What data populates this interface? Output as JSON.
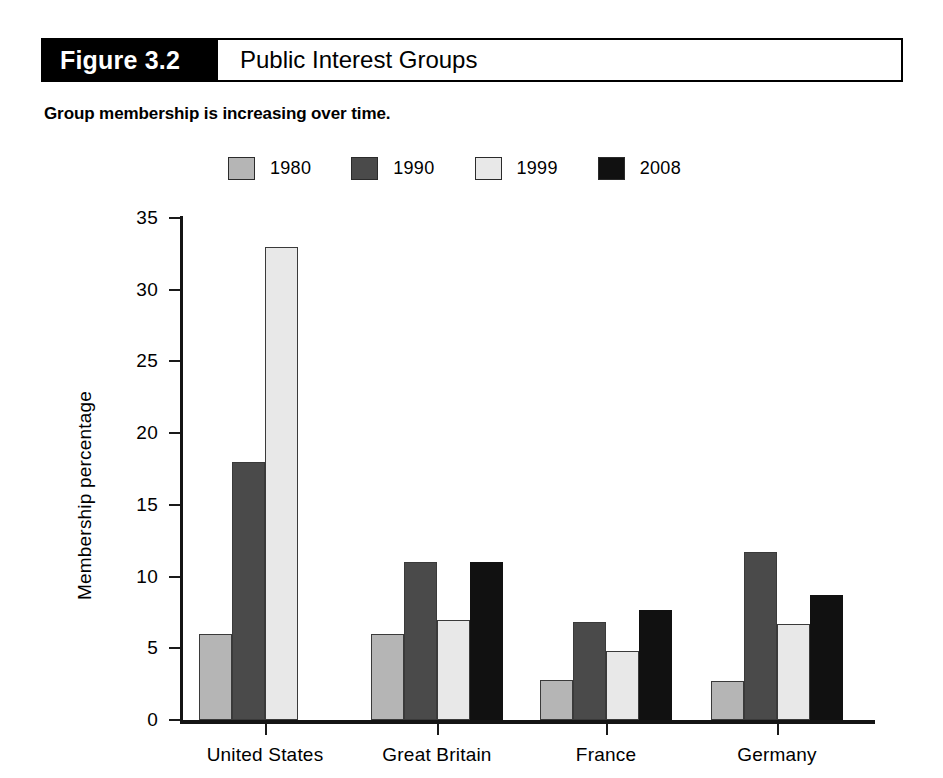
{
  "header": {
    "figure_number": "Figure 3.2",
    "title": "Public Interest Groups"
  },
  "subtitle": "Group membership is increasing over time.",
  "legend": {
    "position": "top-center",
    "items": [
      {
        "label": "1980",
        "color": "#b5b5b5"
      },
      {
        "label": "1990",
        "color": "#4a4a4a"
      },
      {
        "label": "1999",
        "color": "#e8e8e8"
      },
      {
        "label": "2008",
        "color": "#111111"
      }
    ]
  },
  "axes": {
    "y_label": "Membership percentage",
    "y_ticks": [
      "0",
      "5",
      "10",
      "15",
      "20",
      "25",
      "30",
      "35"
    ],
    "x_labels": [
      "United States",
      "Great Britain",
      "France",
      "Germany"
    ]
  },
  "chart_data": {
    "type": "bar",
    "title": "Public Interest Groups",
    "subtitle": "Group membership is increasing over time.",
    "xlabel": "",
    "ylabel": "Membership percentage",
    "ylim": [
      0,
      35
    ],
    "ytick_step": 5,
    "grid": false,
    "legend_position": "top-center",
    "categories": [
      "United States",
      "Great Britain",
      "France",
      "Germany"
    ],
    "series": [
      {
        "name": "1980",
        "color": "#b5b5b5",
        "values": [
          6.0,
          6.0,
          2.8,
          2.7
        ]
      },
      {
        "name": "1990",
        "color": "#4a4a4a",
        "values": [
          18.0,
          11.0,
          6.8,
          11.7
        ]
      },
      {
        "name": "1999",
        "color": "#e8e8e8",
        "values": [
          33.0,
          7.0,
          4.8,
          6.7
        ]
      },
      {
        "name": "2008",
        "color": "#111111",
        "values": [
          null,
          11.0,
          7.7,
          8.7
        ]
      }
    ]
  },
  "geometry": {
    "plot_left": 180,
    "plot_right": 875,
    "baseline_y": 720,
    "top_y": 218,
    "bar_width": 33,
    "group_centers": [
      265,
      437,
      606,
      777
    ]
  }
}
